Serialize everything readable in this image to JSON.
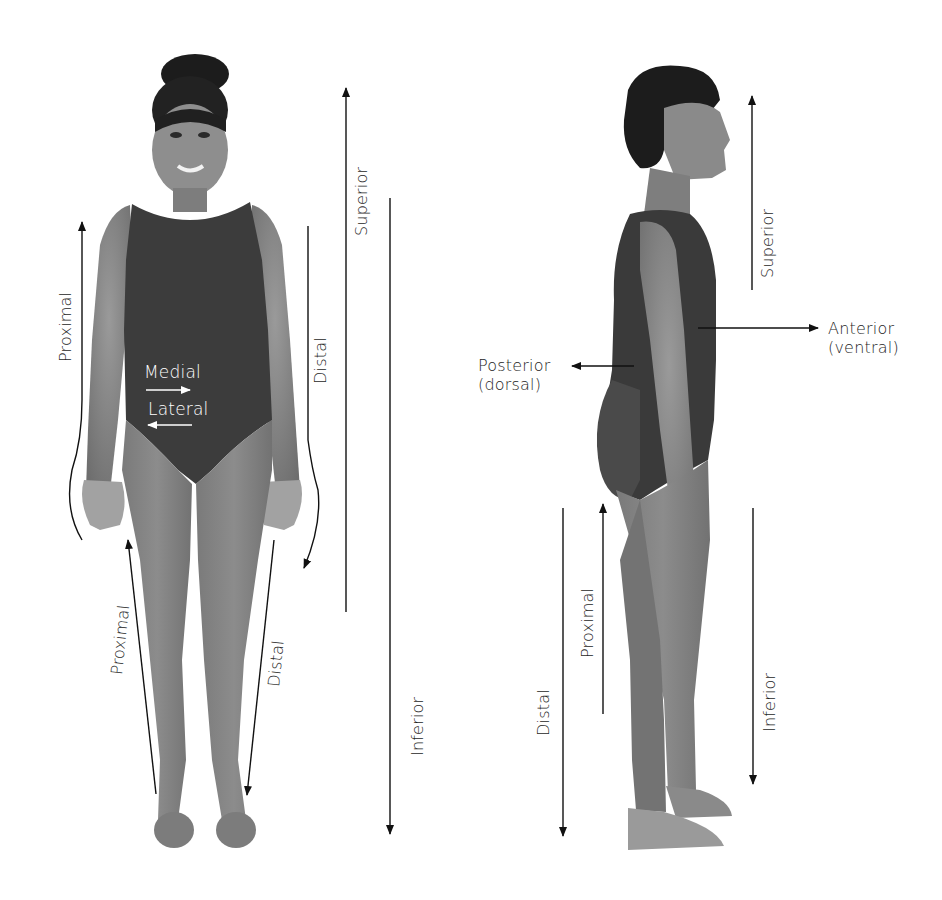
{
  "figure": {
    "type": "anatomical-directional-terms",
    "views": [
      {
        "id": "anterior-view",
        "description": "Front view of standing person in dark leotard"
      },
      {
        "id": "lateral-view",
        "description": "Side (right lateral) view of standing person in dark leotard"
      }
    ],
    "colors": {
      "background": "#ffffff",
      "arrow": "#111111",
      "skin": "#8a8a8a",
      "leotard": "#3a3a3a",
      "hair": "#1c1c1c",
      "text": "#1e1e1e",
      "inline_text": "#ffffff"
    }
  },
  "labels": {
    "front": {
      "arm_proximal": "Proximal",
      "arm_distal": "Distal",
      "medial": "Medial",
      "lateral": "Lateral",
      "leg_proximal": "Proximal",
      "leg_distal": "Distal",
      "superior": "Superior",
      "inferior": "Inferior"
    },
    "side": {
      "superior": "Superior",
      "anterior": "Anterior",
      "anterior_alt": "(ventral)",
      "posterior": "Posterior",
      "posterior_alt": "(dorsal)",
      "leg_proximal": "Proximal",
      "leg_distal": "Distal",
      "inferior": "Inferior"
    }
  }
}
